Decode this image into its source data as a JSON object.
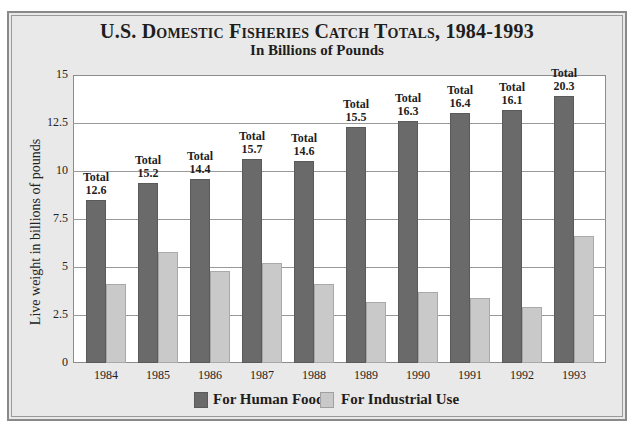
{
  "header": {
    "title": "U.S. Domestic Fisheries Catch Totals, 1984-1993",
    "subtitle": "In Billions of Pounds"
  },
  "axis": {
    "ylabel": "Live weight in billions of pounds",
    "yticks": [
      "0",
      "2.5",
      "5",
      "7.5",
      "10",
      "12.5",
      "15"
    ]
  },
  "legend": {
    "human_food": "For Human Food",
    "industrial_use": "For Industrial Use"
  },
  "total_word": "Total",
  "colors": {
    "human_food": "#6a6a6a",
    "industrial_use": "#c9c9c9",
    "background": "#e9e9e9",
    "plot": "#ffffff"
  },
  "chart_data": {
    "type": "bar",
    "title": "U.S. Domestic Fisheries Catch Totals, 1984-1993",
    "subtitle": "In Billions of Pounds",
    "xlabel": "",
    "ylabel": "Live weight in billions of pounds",
    "ylim": [
      0,
      15
    ],
    "yticks": [
      0,
      2.5,
      5,
      7.5,
      10,
      12.5,
      15
    ],
    "grid": true,
    "legend_position": "bottom",
    "categories": [
      "1984",
      "1985",
      "1986",
      "1987",
      "1988",
      "1989",
      "1990",
      "1991",
      "1992",
      "1993"
    ],
    "series": [
      {
        "name": "For Human Food",
        "values": [
          8.5,
          9.4,
          9.6,
          10.6,
          10.5,
          12.3,
          12.6,
          13.0,
          13.2,
          13.9
        ]
      },
      {
        "name": "For Industrial Use",
        "values": [
          4.1,
          5.8,
          4.8,
          5.2,
          4.1,
          3.2,
          3.7,
          3.4,
          2.9,
          6.6
        ]
      }
    ],
    "annotations": {
      "label_prefix": "Total",
      "totals": [
        "12.6",
        "15.2",
        "14.4",
        "15.7",
        "14.6",
        "15.5",
        "16.3",
        "16.4",
        "16.1",
        "20.3"
      ]
    }
  }
}
